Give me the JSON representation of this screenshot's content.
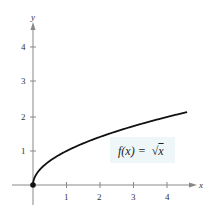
{
  "chart_data": {
    "type": "line",
    "title": "",
    "xlabel": "x",
    "ylabel": "y",
    "xlim": [
      0,
      4.6
    ],
    "ylim": [
      0,
      4.8
    ],
    "x_ticks": [
      "1",
      "2",
      "3",
      "4"
    ],
    "y_ticks": [
      "1",
      "2",
      "3",
      "4"
    ],
    "grid": false,
    "series": [
      {
        "name": "f(x) = √x",
        "x": [
          0,
          0.25,
          0.5,
          1,
          1.5,
          2,
          2.5,
          3,
          3.5,
          4,
          4.6
        ],
        "values": [
          0,
          0.5,
          0.707,
          1,
          1.225,
          1.414,
          1.581,
          1.732,
          1.871,
          2,
          2.145
        ]
      }
    ],
    "annotations": [
      "f(x) = √x",
      "closed point at (0, 0)"
    ]
  },
  "labels": {
    "x_axis": "x",
    "y_axis": "y",
    "function": "f(x) =",
    "sqrt_arg": "x",
    "x_tick_1": "1",
    "x_tick_2": "2",
    "x_tick_3": "3",
    "x_tick_4": "4",
    "y_tick_1": "1",
    "y_tick_2": "2",
    "y_tick_3": "3",
    "y_tick_4": "4"
  },
  "colors": {
    "curve": "#111111",
    "axis": "#888888",
    "label_bg": "#eef6f8"
  }
}
